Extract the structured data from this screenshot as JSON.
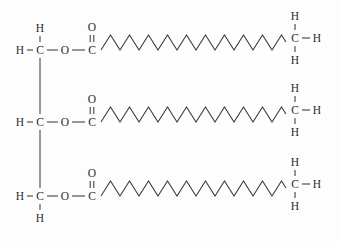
{
  "figure": {
    "name": "triglyceride-structure",
    "background_color": "#fdfdfd",
    "bond_color": "#3a3a3a",
    "atom_color": "#2c2c2c"
  },
  "labels": {
    "carbon": "C",
    "hydrogen": "H",
    "oxygen": "O",
    "bond_dash": "—"
  },
  "glycerol": {
    "name": "glycerol-backbone",
    "carbons": [
      {
        "id": "glycerol-c1",
        "label": "C",
        "x": 40,
        "y": 50,
        "left_h": "H",
        "left_h_x": 20,
        "top_h": "H",
        "top_h_y": 28,
        "bottom_h": null,
        "ester_oxygen": "O",
        "ester_oxygen_x": 65,
        "carbonyl_carbon": "C",
        "carbonyl_carbon_x": 92,
        "carbonyl_oxygen": "O",
        "carbonyl_oxygen_y": 27
      },
      {
        "id": "glycerol-c2",
        "label": "C",
        "x": 40,
        "y": 122,
        "left_h": "H",
        "left_h_x": 20,
        "top_h": null,
        "bottom_h": null,
        "ester_oxygen": "O",
        "ester_oxygen_x": 65,
        "carbonyl_carbon": "C",
        "carbonyl_carbon_x": 92,
        "carbonyl_oxygen": "O",
        "carbonyl_oxygen_y": 99
      },
      {
        "id": "glycerol-c3",
        "label": "C",
        "x": 40,
        "y": 196,
        "left_h": "H",
        "left_h_x": 20,
        "top_h": null,
        "bottom_h": "H",
        "bottom_h_y": 218,
        "ester_oxygen": "O",
        "ester_oxygen_x": 65,
        "carbonyl_carbon": "C",
        "carbonyl_carbon_x": 92,
        "carbonyl_oxygen": "O",
        "carbonyl_oxygen_y": 173
      }
    ]
  },
  "fatty_acid_chains": [
    {
      "id": "fatty-acid-chain-1",
      "attached_to": "glycerol-c1",
      "start_x": 101,
      "baseline_y": 50,
      "zigzag_vertices": 20,
      "period_px": 19,
      "amplitude_px": 15,
      "terminal_methyl": {
        "carbon": "C",
        "carbon_x": 295,
        "carbon_y": 38,
        "top_h": "H",
        "top_h_y": 16,
        "right_h": "H",
        "right_h_x": 317,
        "bottom_h": "H",
        "bottom_h_y": 60
      }
    },
    {
      "id": "fatty-acid-chain-2",
      "attached_to": "glycerol-c2",
      "start_x": 101,
      "baseline_y": 122,
      "zigzag_vertices": 20,
      "period_px": 19,
      "amplitude_px": 15,
      "terminal_methyl": {
        "carbon": "C",
        "carbon_x": 295,
        "carbon_y": 110,
        "top_h": "H",
        "top_h_y": 88,
        "right_h": "H",
        "right_h_x": 317,
        "bottom_h": "H",
        "bottom_h_y": 132
      }
    },
    {
      "id": "fatty-acid-chain-3",
      "attached_to": "glycerol-c3",
      "start_x": 101,
      "baseline_y": 196,
      "zigzag_vertices": 20,
      "period_px": 19,
      "amplitude_px": 15,
      "terminal_methyl": {
        "carbon": "C",
        "carbon_x": 295,
        "carbon_y": 184,
        "top_h": "H",
        "top_h_y": 162,
        "right_h": "H",
        "right_h_x": 317,
        "bottom_h": "H",
        "bottom_h_y": 206
      }
    }
  ]
}
